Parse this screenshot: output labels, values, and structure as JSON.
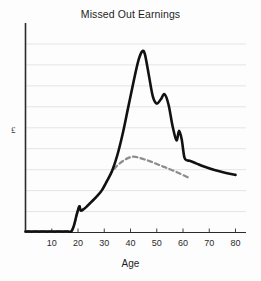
{
  "chart_data": {
    "type": "line",
    "title": "Missed Out Earnings",
    "xlabel": "Age",
    "ylabel": "£",
    "xlim": [
      0,
      84
    ],
    "ylim": [
      0,
      10
    ],
    "grid": true,
    "gridlines_y": [
      1,
      2,
      3,
      4,
      5,
      6,
      7,
      8,
      9
    ],
    "legend": "none",
    "xticks": [
      10,
      20,
      30,
      40,
      50,
      60,
      70,
      80
    ],
    "xtick_labels": [
      "10",
      "20",
      "30",
      "40",
      "50",
      "60",
      "70",
      "80"
    ],
    "yticks": [],
    "ytick_labels": [],
    "series": [
      {
        "name": "Actual earnings",
        "style": "solid",
        "color": "#111111",
        "width": 2.6,
        "x": [
          0,
          4,
          8,
          12,
          16,
          17.5,
          18.5,
          19.5,
          20.5,
          21,
          22,
          23,
          25,
          27,
          29,
          31,
          33,
          35,
          37,
          39,
          41,
          43,
          44.5,
          45.5,
          47,
          48.5,
          50,
          51.5,
          53,
          54.5,
          56,
          57.5,
          58.5,
          59.5,
          60.5,
          61.5,
          62.5,
          65,
          68,
          72,
          76,
          80
        ],
        "y": [
          0.05,
          0.05,
          0.05,
          0.05,
          0.05,
          0.06,
          0.35,
          0.85,
          1.25,
          1.05,
          1.1,
          1.2,
          1.45,
          1.7,
          2.0,
          2.45,
          2.95,
          3.7,
          4.7,
          5.9,
          7.1,
          8.2,
          8.65,
          8.5,
          7.5,
          6.5,
          6.15,
          6.35,
          6.6,
          6.1,
          5.1,
          4.4,
          4.85,
          4.45,
          3.6,
          3.45,
          3.42,
          3.3,
          3.15,
          2.98,
          2.85,
          2.75
        ]
      },
      {
        "name": "Reduced earnings",
        "style": "dashed",
        "color": "#8d8d8d",
        "width": 2.2,
        "x": [
          0,
          4,
          8,
          12,
          16,
          17.5,
          18.5,
          19.5,
          20.5,
          21,
          22,
          23,
          25,
          27,
          29,
          31,
          33,
          35,
          37,
          39,
          41,
          43,
          45,
          47,
          49,
          51,
          53,
          55,
          57,
          59,
          61,
          62
        ],
        "y": [
          0.05,
          0.05,
          0.05,
          0.05,
          0.05,
          0.06,
          0.35,
          0.85,
          1.25,
          1.05,
          1.1,
          1.2,
          1.45,
          1.7,
          2.0,
          2.45,
          2.9,
          3.2,
          3.4,
          3.55,
          3.62,
          3.58,
          3.5,
          3.42,
          3.32,
          3.22,
          3.12,
          3.02,
          2.92,
          2.8,
          2.68,
          2.62
        ]
      }
    ],
    "annotations": []
  },
  "axes": {
    "y_axis_label": "£",
    "x_axis_title": "Age",
    "tick_labels": [
      "10",
      "20",
      "30",
      "40",
      "50",
      "60",
      "70",
      "80"
    ]
  },
  "colors": {
    "background": "#fdfdfd",
    "axis": "#2b2b2b",
    "gridline": "#e2e2e2",
    "solid_line": "#111111",
    "dashed_line": "#8d8d8d",
    "text": "#1d1d1d"
  }
}
